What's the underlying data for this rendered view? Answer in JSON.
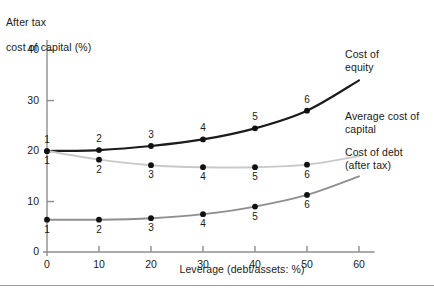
{
  "chart_data": {
    "type": "line",
    "title": "",
    "ylabel_line1": "After tax",
    "ylabel_line2": "cost of capital (%)",
    "xlabel": "Leverage (debt/assets: %)",
    "x": [
      0,
      10,
      20,
      30,
      40,
      50
    ],
    "point_labels": [
      "1",
      "2",
      "3",
      "4",
      "5",
      "6"
    ],
    "xlim": [
      0,
      65
    ],
    "ylim": [
      0,
      42
    ],
    "xticks": [
      "0",
      "10",
      "20",
      "30",
      "40",
      "50",
      "60"
    ],
    "xtick_values": [
      0,
      10,
      20,
      30,
      40,
      50,
      60
    ],
    "yticks": [
      "0",
      "10",
      "20",
      "30",
      "40"
    ],
    "ytick_values": [
      0,
      10,
      20,
      30,
      40
    ],
    "grid": false,
    "legend_position": "right-inline-annotations",
    "series": [
      {
        "name": "Cost of equity",
        "label_line1": "Cost of",
        "label_line2": "equity",
        "color": "#1c1c1c",
        "values": [
          20.0,
          20.2,
          21.0,
          22.3,
          24.5,
          28.0
        ],
        "extended_to_x": 60,
        "extended_value": 34.0,
        "label_position_above": true
      },
      {
        "name": "Average cost of capital",
        "label_line1": "Average cost of",
        "label_line2": "capital",
        "color": "#c9c9c9",
        "values": [
          20.0,
          18.3,
          17.2,
          16.8,
          16.8,
          17.3
        ],
        "extended_to_x": 60,
        "extended_value": 19.0,
        "label_position_above": false
      },
      {
        "name": "Cost of debt (after tax)",
        "label_line1": "Cost of debt",
        "label_line2": "(after tax)",
        "color": "#8e8e8e",
        "values": [
          6.4,
          6.4,
          6.7,
          7.5,
          9.0,
          11.3
        ],
        "extended_to_x": 60,
        "extended_value": 15.0,
        "label_position_above": false
      }
    ],
    "axis_color": "#8e8e8e",
    "marker_color": "#111111"
  }
}
